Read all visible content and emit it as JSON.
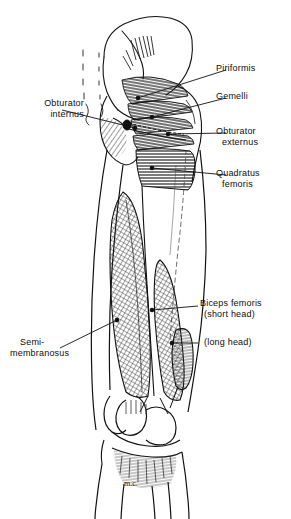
{
  "figure": {
    "background_color": "#ffffff",
    "ink_color": "#111111",
    "signature": "m.c."
  },
  "labels": {
    "piriformis": "Piriformis",
    "gemelli": "Gemelli",
    "obturator_externus_line1": "Obturator",
    "obturator_externus_line2": "externus",
    "quadratus_femoris_line1": "Quadratus",
    "quadratus_femoris_line2": "femoris",
    "obturator_internus_line1": "Obturator",
    "obturator_internus_line2": "internus",
    "semimembranosus_line1": "Semi-",
    "semimembranosus_line2": "membranosus",
    "biceps_femoris": "Biceps femoris",
    "biceps_short_head": "(short head)",
    "biceps_long_head": "(long head)"
  }
}
